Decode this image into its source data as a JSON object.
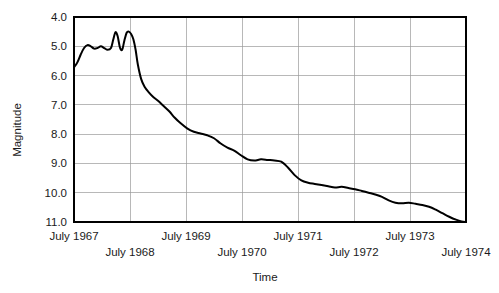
{
  "chart_data": {
    "type": "line",
    "title": "",
    "xlabel": "Time",
    "ylabel": "Magnitude",
    "y_inverted": true,
    "ylim": [
      4.0,
      11.0
    ],
    "grid": true,
    "legend": "none",
    "y_ticks": [
      "4.0",
      "5.0",
      "6.0",
      "7.0",
      "8.0",
      "9.0",
      "10.0",
      "11.0"
    ],
    "y_tick_values": [
      4.0,
      5.0,
      6.0,
      7.0,
      8.0,
      9.0,
      10.0,
      11.0
    ],
    "x_ticks": [
      "July 1967",
      "July 1968",
      "July 1969",
      "July 1970",
      "July 1971",
      "July 1972",
      "July 1973",
      "July 1974"
    ],
    "x_tick_values": [
      1967.5,
      1968.5,
      1969.5,
      1970.5,
      1971.5,
      1972.5,
      1973.5,
      1974.5
    ],
    "x_tick_rows": [
      0,
      1,
      0,
      1,
      0,
      1,
      0,
      1
    ],
    "xlim": [
      1967.5,
      1974.5
    ],
    "series": [
      {
        "name": "magnitude",
        "x": [
          1967.5,
          1967.56,
          1967.62,
          1967.68,
          1967.74,
          1967.8,
          1967.86,
          1967.92,
          1967.98,
          1968.04,
          1968.1,
          1968.16,
          1968.2,
          1968.24,
          1968.28,
          1968.32,
          1968.36,
          1968.4,
          1968.44,
          1968.48,
          1968.52,
          1968.56,
          1968.6,
          1968.64,
          1968.7,
          1968.76,
          1968.84,
          1968.92,
          1969.0,
          1969.1,
          1969.2,
          1969.3,
          1969.4,
          1969.52,
          1969.64,
          1969.76,
          1969.88,
          1970.0,
          1970.12,
          1970.24,
          1970.36,
          1970.48,
          1970.6,
          1970.72,
          1970.84,
          1970.96,
          1971.08,
          1971.2,
          1971.32,
          1971.44,
          1971.56,
          1971.68,
          1971.8,
          1971.92,
          1972.04,
          1972.16,
          1972.28,
          1972.4,
          1972.52,
          1972.64,
          1972.76,
          1972.88,
          1973.0,
          1973.12,
          1973.24,
          1973.36,
          1973.48,
          1973.6,
          1973.72,
          1973.84,
          1973.96,
          1974.08,
          1974.2,
          1974.32,
          1974.42,
          1974.5
        ],
        "y": [
          5.72,
          5.55,
          5.28,
          5.06,
          4.96,
          5.0,
          5.08,
          5.06,
          5.0,
          5.06,
          5.12,
          5.06,
          4.78,
          4.52,
          4.66,
          5.04,
          5.12,
          4.8,
          4.54,
          4.5,
          4.58,
          4.76,
          5.12,
          5.62,
          6.12,
          6.38,
          6.58,
          6.74,
          6.86,
          7.04,
          7.22,
          7.44,
          7.62,
          7.8,
          7.92,
          7.98,
          8.04,
          8.14,
          8.32,
          8.46,
          8.56,
          8.72,
          8.86,
          8.9,
          8.86,
          8.88,
          8.9,
          8.94,
          9.14,
          9.4,
          9.58,
          9.66,
          9.7,
          9.74,
          9.78,
          9.82,
          9.8,
          9.84,
          9.88,
          9.94,
          10.0,
          10.06,
          10.14,
          10.26,
          10.34,
          10.36,
          10.34,
          10.38,
          10.42,
          10.48,
          10.58,
          10.7,
          10.82,
          10.92,
          10.98,
          11.0
        ]
      }
    ]
  }
}
